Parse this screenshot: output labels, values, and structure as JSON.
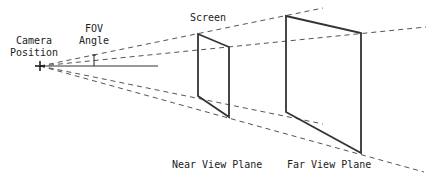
{
  "labels": {
    "camera_position_line1": "Camera",
    "camera_position_line2": "Position",
    "fov_line1": "FOV",
    "fov_line2": "Angle",
    "screen": "Screen",
    "near_view_plane": "Near View Plane",
    "far_view_plane": "Far View Plane"
  },
  "colors": {
    "line": "#333333",
    "dashed": "#555555"
  }
}
